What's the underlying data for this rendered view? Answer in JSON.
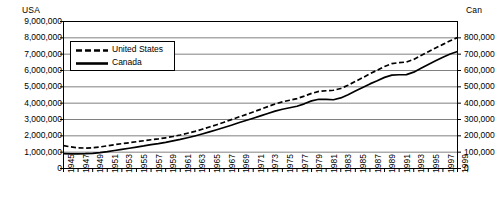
{
  "axes": {
    "left_title": "USA",
    "right_title": "Can",
    "left_ticks": [
      "9,000,000",
      "8,000,000",
      "7,000,000",
      "6,000,000",
      "5,000,000",
      "4,000,000",
      "3,000,000",
      "2,000,000",
      "1,000,000",
      "0"
    ],
    "right_ticks": [
      "800,000",
      "700,000",
      "600,000",
      "500,000",
      "400,000",
      "300,000",
      "200,000",
      "100,000",
      "0"
    ],
    "x_ticks": [
      "1945",
      "1947",
      "1949",
      "1951",
      "1953",
      "1955",
      "1957",
      "1959",
      "1961",
      "1963",
      "1965",
      "1967",
      "1969",
      "1971",
      "1973",
      "1975",
      "1977",
      "1979",
      "1981",
      "1983",
      "1985",
      "1987",
      "1989",
      "1991",
      "1993",
      "1995",
      "1997",
      "1999"
    ]
  },
  "legend": {
    "united_states": "United States",
    "canada": "Canada"
  },
  "colors": {
    "line": "#000000",
    "grid": "#808080",
    "frame": "#000000",
    "background": "#ffffff"
  },
  "chart_data": {
    "type": "line",
    "title": "",
    "xlabel": "",
    "ylabel": "USA",
    "y2label": "Can",
    "ylim": [
      0,
      9000000
    ],
    "y2lim": [
      0,
      800000
    ],
    "grid": true,
    "legend_position": "top-left",
    "x": [
      1945,
      1946,
      1947,
      1948,
      1949,
      1950,
      1951,
      1952,
      1953,
      1954,
      1955,
      1956,
      1957,
      1958,
      1959,
      1960,
      1961,
      1962,
      1963,
      1964,
      1965,
      1966,
      1967,
      1968,
      1969,
      1970,
      1971,
      1972,
      1973,
      1974,
      1975,
      1976,
      1977,
      1978,
      1979,
      1980,
      1981,
      1982,
      1983,
      1984,
      1985,
      1986,
      1987,
      1988,
      1989,
      1990,
      1991,
      1992,
      1993,
      1994,
      1995,
      1996,
      1997,
      1998,
      1999
    ],
    "series": [
      {
        "name": "United States",
        "axis": "left",
        "style": "dashed",
        "values": [
          1400000,
          1320000,
          1265000,
          1250000,
          1265000,
          1320000,
          1390000,
          1460000,
          1520000,
          1575000,
          1640000,
          1700000,
          1760000,
          1810000,
          1880000,
          1960000,
          2050000,
          2160000,
          2270000,
          2400000,
          2540000,
          2680000,
          2830000,
          2990000,
          3150000,
          3300000,
          3460000,
          3620000,
          3790000,
          3950000,
          4080000,
          4180000,
          4280000,
          4430000,
          4600000,
          4720000,
          4760000,
          4790000,
          4900000,
          5100000,
          5330000,
          5560000,
          5800000,
          6020000,
          6250000,
          6420000,
          6480000,
          6520000,
          6680000,
          6920000,
          7150000,
          7380000,
          7600000,
          7820000,
          8020000
        ]
      },
      {
        "name": "Canada",
        "axis": "right",
        "style": "solid",
        "values": [
          91000,
          90000,
          90000,
          91000,
          93000,
          97000,
          103000,
          110000,
          117000,
          124000,
          131000,
          138000,
          146000,
          152000,
          160000,
          169000,
          178000,
          188000,
          199000,
          211000,
          224000,
          237000,
          251000,
          265000,
          280000,
          294000,
          308000,
          322000,
          337000,
          351000,
          363000,
          372000,
          381000,
          396000,
          414000,
          424000,
          423000,
          421000,
          432000,
          452000,
          474000,
          496000,
          518000,
          537000,
          558000,
          572000,
          574000,
          575000,
          590000,
          614000,
          637000,
          659000,
          681000,
          701000,
          716000
        ]
      }
    ]
  }
}
